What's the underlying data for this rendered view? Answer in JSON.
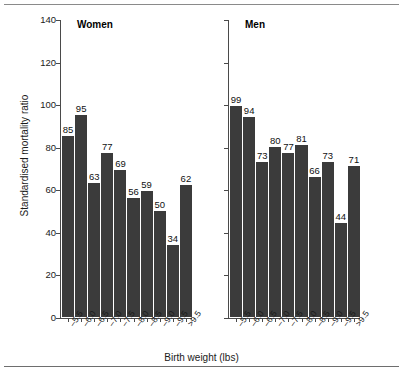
{
  "chart_data": {
    "type": "bar",
    "title": "",
    "xlabel": "Birth weight (lbs)",
    "ylabel": "Standardised mortality ratio",
    "ylim": [
      0,
      140
    ],
    "ytick_step": 20,
    "yticks": [
      0,
      20,
      40,
      60,
      80,
      100,
      120,
      140
    ],
    "grid": false,
    "legend": "none",
    "panels": [
      {
        "label": "Women",
        "categories": [
          "–5.5",
          "–6.0",
          "–6.5",
          "–7.0",
          "–7.5",
          "–8.0",
          "–8.5",
          "–9.0",
          "–9.5",
          ">9.5"
        ],
        "values": [
          85,
          95,
          63,
          77,
          69,
          56,
          59,
          50,
          34,
          62
        ]
      },
      {
        "label": "Men",
        "categories": [
          "–5.5",
          "–6.0",
          "–6.5",
          "–7.0",
          "–7.5",
          "–8.0",
          "–8.5",
          "–9.0",
          "–9.5",
          ">9.5"
        ],
        "values": [
          99,
          94,
          73,
          80,
          77,
          81,
          66,
          73,
          44,
          71
        ]
      }
    ],
    "bar_color": "#3b3b3b",
    "axis_color": "#4a4a4a"
  },
  "figure": {
    "axis_title_x": "Birth weight (lbs)",
    "axis_title_y": "Standardised mortality ratio"
  }
}
